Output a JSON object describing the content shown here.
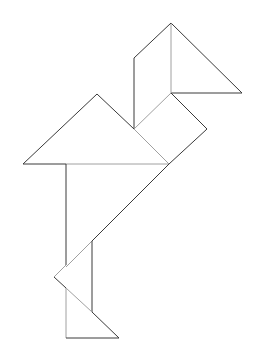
{
  "figure": {
    "background": "#ffffff",
    "outer_stroke": "#3a3a3a",
    "inner_stroke": "#a0a0a0",
    "pieces": [
      {
        "name": "head-triangle",
        "points": "171,23 171,93 242,93"
      },
      {
        "name": "neck-parallelogram",
        "points": "134,58 171,23 171,93 134,129"
      },
      {
        "name": "body-square",
        "points": "171,93 207,129 169,164 134,129"
      },
      {
        "name": "wing-triangle",
        "points": "23,164 97,94 169,164"
      },
      {
        "name": "body-large-triangle",
        "points": "66,164 169,164 66,265"
      },
      {
        "name": "leg-triangle",
        "points": "92,241 92,312 54,277"
      },
      {
        "name": "foot-triangle",
        "points": "66,288 119,338 66,338"
      }
    ]
  }
}
